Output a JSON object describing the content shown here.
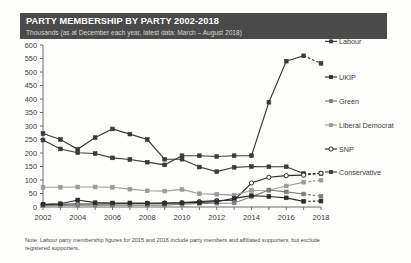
{
  "header": {
    "title": "PARTY MEMBERSHIP BY PARTY 2002-2018",
    "subtitle": "Thousands (as at December each year, latest data: March – August 2018)",
    "band_color": "#4a4a4a",
    "title_color": "#ffffff",
    "subtitle_color": "#d7d7d3"
  },
  "footnote": {
    "text": "Note: Labour party membership figures for 2015 and 2016 include party members and affiliated supporters, but exclude registered supporters."
  },
  "axis": {
    "y_ticks": [
      0,
      50,
      100,
      150,
      200,
      250,
      300,
      350,
      400,
      450,
      500,
      550,
      600
    ],
    "x_ticks": [
      2002,
      2004,
      2006,
      2008,
      2010,
      2012,
      2014,
      2016,
      2018
    ],
    "x_all_years": [
      2002,
      2003,
      2004,
      2005,
      2006,
      2007,
      2008,
      2009,
      2010,
      2011,
      2012,
      2013,
      2014,
      2015,
      2016,
      2017,
      2018
    ]
  },
  "labels": {
    "labour_inline": "Labour"
  },
  "chart_data": {
    "type": "line",
    "title": "PARTY MEMBERSHIP BY PARTY 2002-2018",
    "subtitle": "Thousands (as at December each year, latest data: March – August 2018)",
    "xlabel": "",
    "ylabel": "Thousands",
    "xlim": [
      2002,
      2018
    ],
    "ylim": [
      0,
      600
    ],
    "grid": false,
    "legend_position": "right",
    "x": [
      2002,
      2003,
      2004,
      2005,
      2006,
      2007,
      2008,
      2009,
      2010,
      2011,
      2012,
      2013,
      2014,
      2015,
      2016,
      2017,
      2018
    ],
    "dashed_from_year": 2017,
    "series": [
      {
        "name": "Labour",
        "color": "#3a3a3a",
        "marker": "square-filled",
        "label_inline": "Labour",
        "values": [
          248,
          215,
          201,
          198,
          182,
          176,
          166,
          156,
          190,
          190,
          187,
          190,
          190,
          388,
          540,
          560,
          532
        ]
      },
      {
        "name": "Conservative",
        "color": "#3a3a3a",
        "marker": "square-filled",
        "values": [
          272,
          250,
          214,
          257,
          289,
          270,
          250,
          177,
          177,
          148,
          131,
          147,
          150,
          149,
          149,
          124,
          124
        ]
      },
      {
        "name": "SNP",
        "color": "#2b2b2b",
        "marker": "circle-open",
        "values": [
          9,
          10,
          11,
          11,
          12,
          13,
          14,
          15,
          16,
          20,
          24,
          25,
          89,
          110,
          116,
          118,
          125
        ]
      },
      {
        "name": "Liberal Democrat",
        "color": "#9a9a9a",
        "marker": "square-filled",
        "values": [
          73,
          73,
          74,
          74,
          73,
          66,
          60,
          59,
          65,
          49,
          47,
          44,
          61,
          62,
          78,
          92,
          99
        ]
      },
      {
        "name": "Green",
        "color": "#7d7d7d",
        "marker": "square-filled",
        "values": [
          5,
          6,
          7,
          7,
          7,
          7,
          7,
          7,
          10,
          13,
          14,
          15,
          38,
          63,
          56,
          48,
          40
        ]
      },
      {
        "name": "UKIP",
        "color": "#2b2b2b",
        "marker": "square-filled",
        "values": [
          10,
          12,
          26,
          16,
          15,
          15,
          14,
          14,
          15,
          17,
          20,
          32,
          42,
          39,
          34,
          21,
          22
        ]
      }
    ],
    "legend": [
      {
        "name": "Conservative",
        "color": "#3a3a3a",
        "marker": "square-filled"
      },
      {
        "name": "SNP",
        "color": "#2b2b2b",
        "marker": "circle-open"
      },
      {
        "name": "Liberal Democrat",
        "color": "#9a9a9a",
        "marker": "square-filled"
      },
      {
        "name": "Green",
        "color": "#7d7d7d",
        "marker": "square-filled"
      },
      {
        "name": "UKIP",
        "color": "#2b2b2b",
        "marker": "square-filled"
      }
    ]
  }
}
